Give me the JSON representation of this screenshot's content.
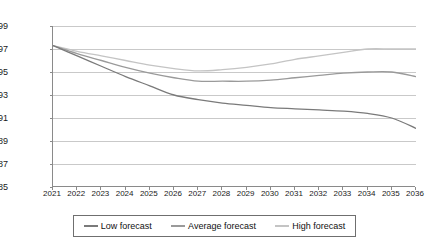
{
  "chart_data": {
    "type": "line",
    "title": "",
    "xlabel": "",
    "ylabel": "Population (millions)",
    "ylim": [
      85,
      99
    ],
    "ytick_step": 2,
    "yticks": [
      99,
      97,
      95,
      93,
      91,
      89,
      87,
      85
    ],
    "grid": true,
    "legend_position": "bottom",
    "x": [
      2021,
      2022,
      2023,
      2024,
      2025,
      2026,
      2027,
      2028,
      2029,
      2030,
      2031,
      2032,
      2033,
      2034,
      2035,
      2036
    ],
    "categories": [
      "2021",
      "2022",
      "2023",
      "2024",
      "2025",
      "2026",
      "2027",
      "2028",
      "2029",
      "2030",
      "2031",
      "2032",
      "2033",
      "2034",
      "2035",
      "2036"
    ],
    "series": [
      {
        "name": "Low forecast",
        "color": "#7a7a7a",
        "values": [
          97.3,
          96.4,
          95.5,
          94.6,
          93.8,
          93.0,
          92.6,
          92.3,
          92.1,
          91.9,
          91.8,
          91.7,
          91.6,
          91.4,
          91.0,
          90.1
        ]
      },
      {
        "name": "Average forecast",
        "color": "#9a9a9a",
        "values": [
          97.3,
          96.6,
          96.0,
          95.4,
          94.9,
          94.5,
          94.2,
          94.2,
          94.2,
          94.3,
          94.5,
          94.7,
          94.9,
          95.0,
          95.0,
          94.6
        ]
      },
      {
        "name": "High forecast",
        "color": "#c4c4c4",
        "values": [
          97.3,
          96.8,
          96.4,
          96.0,
          95.6,
          95.3,
          95.1,
          95.2,
          95.4,
          95.7,
          96.1,
          96.4,
          96.7,
          97.0,
          97.0,
          97.0
        ]
      }
    ]
  },
  "legend": {
    "items": [
      {
        "label": "Low forecast"
      },
      {
        "label": "Average forecast"
      },
      {
        "label": "High forecast"
      }
    ]
  }
}
